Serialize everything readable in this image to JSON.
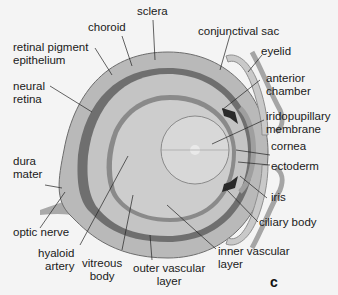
{
  "figure": {
    "panel_letter": "c",
    "labels": {
      "sclera": "sclera",
      "choroid": "choroid",
      "retinal_pigment_epithelium_1": "retinal pigment",
      "retinal_pigment_epithelium_2": "epithelium",
      "neural_retina_1": "neural",
      "neural_retina_2": "retina",
      "dura_mater_1": "dura",
      "dura_mater_2": "mater",
      "optic_nerve": "optic nerve",
      "hyaloid_artery_1": "hyaloid",
      "hyaloid_artery_2": "artery",
      "vitreous_body_1": "vitreous",
      "vitreous_body_2": "body",
      "outer_vascular_layer_1": "outer vascular",
      "outer_vascular_layer_2": "layer",
      "inner_vascular_layer_1": "inner vascular",
      "inner_vascular_layer_2": "layer",
      "conjunctival_sac": "conjunctival sac",
      "eyelid": "eyelid",
      "anterior_chamber_1": "anterior",
      "anterior_chamber_2": "chamber",
      "iridopupillary_membrane_1": "iridopupillary",
      "iridopupillary_membrane_2": "membrane",
      "cornea": "cornea",
      "ectoderm": "ectoderm",
      "iris": "iris",
      "ciliary_body": "ciliary body"
    },
    "colors": {
      "background": "#f4f4f4",
      "sclera": "#b9b9b9",
      "choroid": "#6e6e6e",
      "retina": "#c6c6c6",
      "vitreous": "#cfcfcf",
      "lens": "#d8d8d8",
      "dark": "#2a2a2a"
    }
  }
}
